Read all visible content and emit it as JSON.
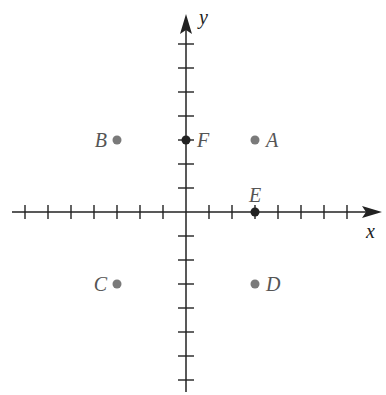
{
  "diagram": {
    "type": "coordinate-plane",
    "axes": {
      "x_label": "x",
      "y_label": "y",
      "x_ticks": [
        -7,
        -6,
        -5,
        -4,
        -3,
        -2,
        -1,
        1,
        2,
        3,
        4,
        5,
        6,
        7
      ],
      "y_ticks": [
        -7,
        -6,
        -5,
        -4,
        -3,
        -2,
        -1,
        1,
        2,
        3,
        4,
        5,
        6,
        7
      ],
      "tick_labels_shown": false
    },
    "points": [
      {
        "label": "A",
        "x": 3,
        "y": 3,
        "style": "gray-dot",
        "label_side": "right"
      },
      {
        "label": "B",
        "x": -3,
        "y": 3,
        "style": "gray-dot",
        "label_side": "left"
      },
      {
        "label": "C",
        "x": -3,
        "y": -3,
        "style": "gray-dot",
        "label_side": "left"
      },
      {
        "label": "D",
        "x": 3,
        "y": -3,
        "style": "gray-dot",
        "label_side": "right"
      },
      {
        "label": "E",
        "x": 3,
        "y": 0,
        "style": "black-dot-on-axis",
        "label_side": "above"
      },
      {
        "label": "F",
        "x": 0,
        "y": 3,
        "style": "black-dot-on-axis",
        "label_side": "right"
      }
    ],
    "colors": {
      "axis": "#222222",
      "point_gray": "#7a7a7a",
      "point_black": "#222222",
      "label": "#555555"
    }
  }
}
